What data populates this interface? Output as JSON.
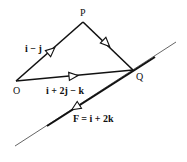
{
  "diagram": {
    "points": {
      "P": {
        "label": "P"
      },
      "O": {
        "label": "O"
      },
      "Q": {
        "label": "Q"
      }
    },
    "edges": {
      "OP": {
        "label": "i − j"
      },
      "OQ": {
        "label": "i + 2j − k"
      },
      "PQ": {
        "label": ""
      }
    },
    "force": {
      "label": "F = i + 2k"
    },
    "colors": {
      "stroke": "#111111",
      "background": "#ffffff"
    }
  }
}
